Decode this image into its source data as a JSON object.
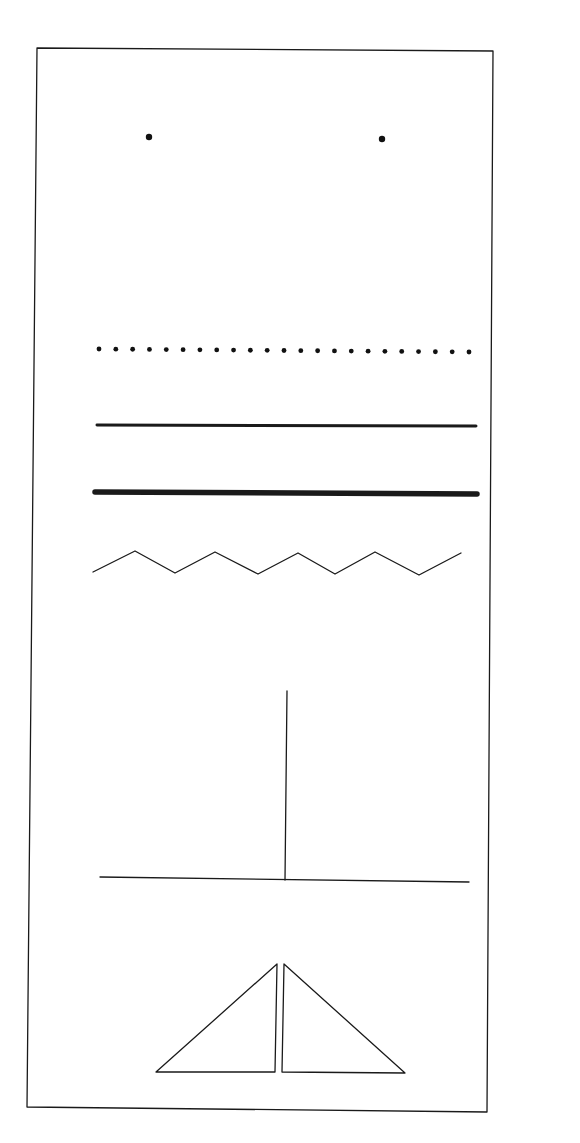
{
  "canvas": {
    "width": 580,
    "height": 1143,
    "background": "#ffffff",
    "ink_color": "#1a1a1a"
  },
  "frame": {
    "corners": [
      [
        37,
        48
      ],
      [
        493,
        51
      ],
      [
        487,
        1112
      ],
      [
        27,
        1107
      ]
    ],
    "stroke_width": 1.3
  },
  "elements": [
    {
      "id": "two-dots",
      "type": "dots",
      "points": [
        [
          149,
          137
        ],
        [
          382,
          139
        ]
      ],
      "radius": 3.2
    },
    {
      "id": "dotted-line",
      "type": "dotted-line",
      "start": [
        99,
        349
      ],
      "end": [
        469,
        352
      ],
      "count": 23,
      "radius": 2.4
    },
    {
      "id": "thin-line",
      "type": "line",
      "start": [
        97,
        425
      ],
      "end": [
        476,
        426
      ],
      "stroke_width": 3
    },
    {
      "id": "thick-line",
      "type": "line",
      "start": [
        95,
        492
      ],
      "end": [
        477,
        494
      ],
      "stroke_width": 5.5
    },
    {
      "id": "zigzag-line",
      "type": "polyline",
      "points": [
        [
          93,
          572
        ],
        [
          135,
          551
        ],
        [
          175,
          573
        ],
        [
          215,
          552
        ],
        [
          258,
          574
        ],
        [
          298,
          553
        ],
        [
          335,
          574
        ],
        [
          375,
          552
        ],
        [
          419,
          575
        ],
        [
          461,
          553
        ]
      ],
      "stroke_width": 1.3
    },
    {
      "id": "inverted-t",
      "type": "lines",
      "segments": [
        {
          "start": [
            287,
            691
          ],
          "end": [
            285,
            880
          ]
        },
        {
          "start": [
            100,
            877
          ],
          "end": [
            469,
            882
          ]
        }
      ],
      "stroke_width": 1.3
    },
    {
      "id": "left-triangle",
      "type": "polygon",
      "points": [
        [
          156,
          1072
        ],
        [
          277,
          964
        ],
        [
          275,
          1072
        ]
      ],
      "stroke_width": 1.3
    },
    {
      "id": "right-triangle",
      "type": "polygon",
      "points": [
        [
          284,
          964
        ],
        [
          282,
          1072
        ],
        [
          405,
          1073
        ]
      ],
      "stroke_width": 1.3
    }
  ]
}
